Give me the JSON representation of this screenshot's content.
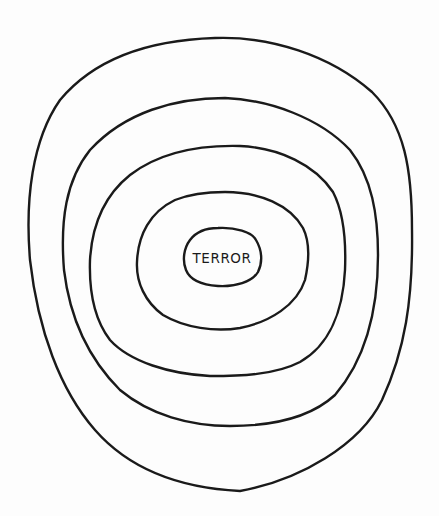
{
  "drawing": {
    "style": "hand-drawn concentric rings",
    "ring_count": 5,
    "stroke_color": "#1a1a1a",
    "background_color": "#fdfdfd",
    "center_label": "TERROR"
  }
}
